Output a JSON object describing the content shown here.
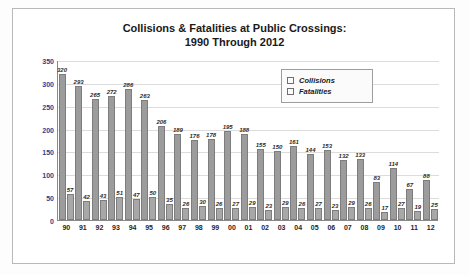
{
  "chart_data": {
    "type": "bar",
    "title": "Collisions & Fatalities at Public Crossings:\n1990 Through 2012",
    "title_line1": "Collisions & Fatalities at Public Crossings:",
    "title_line2": "1990 Through 2012",
    "xlabel": "",
    "ylabel": "",
    "ylim": [
      0,
      350
    ],
    "yticks": [
      0,
      50,
      100,
      150,
      200,
      250,
      300,
      350
    ],
    "grid": true,
    "legend_position": "top-right",
    "categories": [
      "90",
      "91",
      "92",
      "93",
      "94",
      "95",
      "96",
      "97",
      "98",
      "99",
      "00",
      "01",
      "02",
      "03",
      "04",
      "05",
      "06",
      "07",
      "08",
      "09",
      "10",
      "11",
      "12"
    ],
    "series": [
      {
        "name": "Collisions",
        "color": "#9c9c9c",
        "values": [
          320,
          293,
          265,
          272,
          286,
          263,
          206,
          189,
          176,
          178,
          195,
          188,
          155,
          150,
          161,
          144,
          153,
          132,
          133,
          83,
          114,
          67,
          88
        ]
      },
      {
        "name": "Fatalities",
        "color": "#a8a8a8",
        "values": [
          57,
          42,
          43,
          51,
          47,
          50,
          35,
          26,
          30,
          26,
          27,
          29,
          23,
          29,
          26,
          27,
          23,
          29,
          26,
          17,
          27,
          19,
          25
        ]
      }
    ]
  },
  "legend": {
    "items": [
      {
        "label": "Collisions"
      },
      {
        "label": "Fatalities"
      }
    ]
  }
}
